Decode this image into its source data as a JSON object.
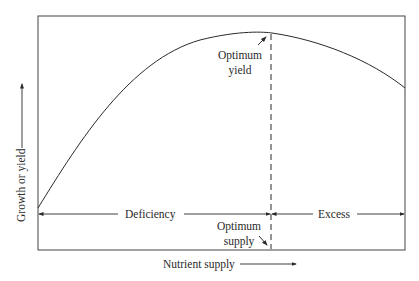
{
  "diagram": {
    "type": "response-curve",
    "xlabel": "Nutrient supply",
    "ylabel": "Growth or yield",
    "annotations": {
      "optimum_yield_line1": "Optimum",
      "optimum_yield_line2": "yield",
      "optimum_supply_line1": "Optimum",
      "optimum_supply_line2": "supply",
      "deficiency": "Deficiency",
      "excess": "Excess"
    },
    "regions": [
      {
        "name": "Deficiency",
        "from": "low supply",
        "to": "optimum supply"
      },
      {
        "name": "Excess",
        "from": "optimum supply",
        "to": "high supply"
      }
    ],
    "curve": "rises steeply from low supply, peaks at optimum yield, declines with excess supply",
    "colors": {
      "line": "#2a2a2a",
      "background": "#ffffff"
    }
  }
}
